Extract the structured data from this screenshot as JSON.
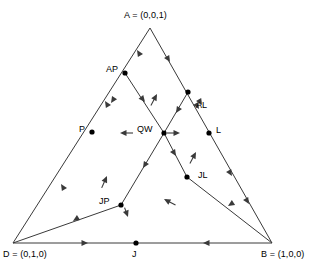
{
  "figure": {
    "type": "diagram",
    "kind": "ternary-composition-triangle",
    "background_color": "#ffffff",
    "line_color": "#3a3a3a",
    "node_color": "#000000",
    "text_color": "#000000",
    "width": 322,
    "height": 271
  },
  "vertices": [
    {
      "id": "A",
      "label": "A = (0,0,1)",
      "x": 150,
      "y": 28,
      "label_x": 124,
      "label_y": 10,
      "has_dot": false
    },
    {
      "id": "D",
      "label": "D = (0,1,0)",
      "x": 13,
      "y": 243,
      "label_x": 3,
      "label_y": 249,
      "has_dot": false
    },
    {
      "id": "B",
      "label": "B = (1,0,0)",
      "x": 272,
      "y": 243,
      "label_x": 261,
      "label_y": 249,
      "has_dot": false
    }
  ],
  "nodes": [
    {
      "id": "AP",
      "label": "AP",
      "x": 125,
      "y": 73,
      "label_x": 106,
      "label_y": 64
    },
    {
      "id": "AL",
      "label": "AL",
      "x": 188,
      "y": 92,
      "label_x": 196,
      "label_y": 100
    },
    {
      "id": "P",
      "label": "P",
      "x": 92,
      "y": 132,
      "label_x": 79,
      "label_y": 124
    },
    {
      "id": "QW",
      "label": "QW",
      "x": 164,
      "y": 133,
      "label_x": 137,
      "label_y": 124
    },
    {
      "id": "L",
      "label": "L",
      "x": 209,
      "y": 133,
      "label_x": 216,
      "label_y": 125
    },
    {
      "id": "JL",
      "label": "JL",
      "x": 187,
      "y": 177,
      "label_x": 198,
      "label_y": 170
    },
    {
      "id": "JP",
      "label": "JP",
      "x": 121,
      "y": 205,
      "label_x": 99,
      "label_y": 196
    },
    {
      "id": "J",
      "label": "J",
      "x": 136,
      "y": 243,
      "label_x": 132,
      "label_y": 249
    }
  ],
  "edges": [
    {
      "id": "edge-A-D",
      "from": "A",
      "to": "D",
      "description": "left outer side from apex A down to vertex D"
    },
    {
      "id": "edge-A-B",
      "from": "A",
      "to": "B",
      "description": "right outer side from apex A down to vertex B"
    },
    {
      "id": "edge-D-B",
      "from": "D",
      "to": "B",
      "description": "bottom base from D to B"
    },
    {
      "id": "edge-AP-QW",
      "from": "AP",
      "to": "QW",
      "description": "boundary from AP down-right to QW"
    },
    {
      "id": "edge-QW-JL",
      "from": "QW",
      "to": "JL",
      "description": "boundary from QW down-right through JL"
    },
    {
      "id": "edge-JL-B",
      "from": "JL",
      "to": "B",
      "description": "boundary from JL down-right to B"
    },
    {
      "id": "edge-AL-QW",
      "from": "AL",
      "to": "QW",
      "description": "boundary from AL down-left to QW"
    },
    {
      "id": "edge-QW-JP",
      "from": "QW",
      "to": "JP",
      "description": "boundary from QW down-left through JP"
    },
    {
      "id": "edge-JP-D",
      "from": "JP",
      "to": "D",
      "description": "boundary from JP down-left to D"
    }
  ],
  "edge_arrows": [
    {
      "id": "arrow-A-D-upper",
      "x": 137,
      "y": 50,
      "angle": -122,
      "on": "edge-A-D",
      "direction": "toward A"
    },
    {
      "id": "arrow-A-D-mid",
      "x": 105,
      "y": 101,
      "angle": -122,
      "on": "edge-A-D",
      "direction": "toward A"
    },
    {
      "id": "arrow-A-D-lower",
      "x": 61,
      "y": 184,
      "angle": -122,
      "on": "edge-A-D",
      "direction": "toward A"
    },
    {
      "id": "arrow-A-B-upper",
      "x": 170,
      "y": 62,
      "angle": 59,
      "on": "edge-A-B",
      "direction": "toward B"
    },
    {
      "id": "arrow-A-B-mid",
      "x": 199,
      "y": 109,
      "angle": 59,
      "on": "edge-A-B",
      "direction": "toward B"
    },
    {
      "id": "arrow-A-B-lower",
      "x": 232,
      "y": 176,
      "angle": 59,
      "on": "edge-A-B",
      "direction": "toward B"
    },
    {
      "id": "arrow-A-B-lowest",
      "x": 249,
      "y": 204,
      "angle": 59,
      "on": "edge-A-B",
      "direction": "toward B"
    },
    {
      "id": "arrow-D-B-left",
      "x": 88,
      "y": 243,
      "angle": 0,
      "on": "edge-D-B",
      "direction": "toward B"
    },
    {
      "id": "arrow-D-B-right",
      "x": 203,
      "y": 243,
      "angle": 180,
      "on": "edge-D-B",
      "direction": "toward D"
    },
    {
      "id": "arrow-AP-QW",
      "x": 145,
      "y": 102,
      "angle": 51,
      "on": "edge-AP-QW",
      "direction": "toward QW"
    },
    {
      "id": "arrow-QW-JL",
      "x": 176,
      "y": 156,
      "angle": 58,
      "on": "edge-QW-JL",
      "direction": "toward JL"
    },
    {
      "id": "arrow-JL-B",
      "x": 228,
      "y": 206,
      "angle": 147,
      "on": "edge-JL-B",
      "direction": "toward JL"
    },
    {
      "id": "arrow-AL-QW",
      "x": 176,
      "y": 113,
      "angle": 122,
      "on": "edge-AL-QW",
      "direction": "toward QW"
    },
    {
      "id": "arrow-QW-JP",
      "x": 143,
      "y": 168,
      "angle": 122,
      "on": "edge-QW-JP",
      "direction": "toward JP"
    },
    {
      "id": "arrow-JP-D",
      "x": 73,
      "y": 221,
      "angle": 148,
      "on": "edge-JP-D",
      "direction": "toward D"
    },
    {
      "id": "arrow-AP-branch",
      "x": 111,
      "y": 103,
      "angle": 123,
      "on": "edge-A-D",
      "direction": "down-left below AP"
    },
    {
      "id": "arrow-AL-branch",
      "x": 202,
      "y": 105,
      "angle": 59,
      "on": "edge-A-B",
      "direction": "down-right below AL"
    }
  ],
  "free_arrows": [
    {
      "id": "free-arrow-qw-left",
      "x": 120,
      "y": 133,
      "angle": 180,
      "tail": 13,
      "description": "points left from QW region"
    },
    {
      "id": "free-arrow-qw-right",
      "x": 180,
      "y": 133,
      "angle": 0,
      "tail": 13,
      "description": "points right from QW region"
    },
    {
      "id": "free-arrow-up-mid",
      "x": 157,
      "y": 94,
      "angle": -62,
      "tail": 13,
      "description": "points up-right above QW"
    },
    {
      "id": "free-arrow-up-left",
      "x": 107,
      "y": 176,
      "angle": -66,
      "tail": 13,
      "description": "points up-right left of JP region"
    },
    {
      "id": "free-arrow-up-right",
      "x": 196,
      "y": 152,
      "angle": -62,
      "tail": 13,
      "description": "points up-right above JL"
    },
    {
      "id": "free-arrow-down-left",
      "x": 164,
      "y": 199,
      "angle": 208,
      "tail": 13,
      "description": "points down-left in lower interior"
    },
    {
      "id": "free-arrow-jp-down",
      "x": 128,
      "y": 217,
      "angle": 70,
      "tail": 10,
      "description": "short arrow from JP pointing down-right"
    }
  ]
}
